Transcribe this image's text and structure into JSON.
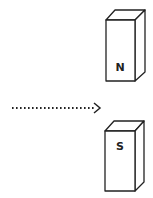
{
  "diagram": {
    "magnets": [
      {
        "pole": "N",
        "position": "top"
      },
      {
        "pole": "S",
        "position": "bottom"
      }
    ],
    "arrow": {
      "style": "dotted",
      "direction": "right"
    },
    "colors": {
      "stroke": "#222222",
      "background": "#ffffff"
    }
  }
}
